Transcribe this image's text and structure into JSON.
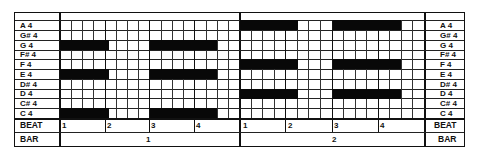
{
  "pitches": [
    "A  4",
    "G# 4",
    "G  4",
    "F# 4",
    "F  4",
    "E  4",
    "D# 4",
    "D  4",
    "C# 4",
    "C  4"
  ],
  "row_labels": {
    "beat": "BEAT",
    "bar": "BAR"
  },
  "bars": [
    {
      "number": "1",
      "beats": [
        "1",
        "2",
        "3",
        "4"
      ]
    },
    {
      "number": "2",
      "beats": [
        "1",
        "2",
        "3",
        "4"
      ]
    }
  ],
  "notes": [
    {
      "bar": 1,
      "pitch": "G4",
      "start_beat": 1,
      "length_sixteenths": 4
    },
    {
      "bar": 1,
      "pitch": "E4",
      "start_beat": 1,
      "length_sixteenths": 4
    },
    {
      "bar": 1,
      "pitch": "C4",
      "start_beat": 1,
      "length_sixteenths": 4
    },
    {
      "bar": 1,
      "pitch": "G4",
      "start_beat": 3,
      "length_sixteenths": 6
    },
    {
      "bar": 1,
      "pitch": "E4",
      "start_beat": 3,
      "length_sixteenths": 6
    },
    {
      "bar": 1,
      "pitch": "C4",
      "start_beat": 3,
      "length_sixteenths": 6
    },
    {
      "bar": 2,
      "pitch": "A4",
      "start_beat": 1,
      "length_sixteenths": 5
    },
    {
      "bar": 2,
      "pitch": "F4",
      "start_beat": 1,
      "length_sixteenths": 5
    },
    {
      "bar": 2,
      "pitch": "D4",
      "start_beat": 1,
      "length_sixteenths": 5
    },
    {
      "bar": 2,
      "pitch": "A4",
      "start_beat": 3,
      "length_sixteenths": 6
    },
    {
      "bar": 2,
      "pitch": "F4",
      "start_beat": 3,
      "length_sixteenths": 6
    },
    {
      "bar": 2,
      "pitch": "D4",
      "start_beat": 3,
      "length_sixteenths": 6
    }
  ]
}
